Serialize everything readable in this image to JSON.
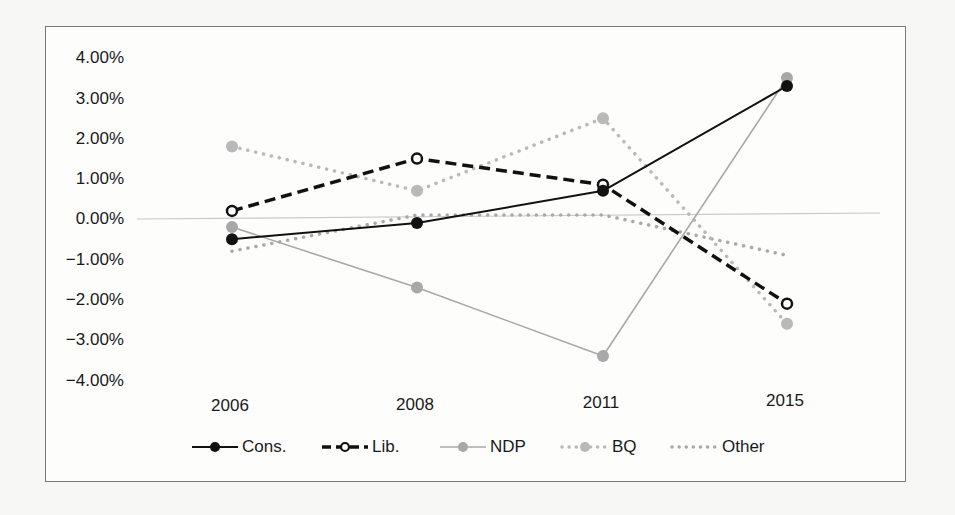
{
  "chart_data": {
    "type": "line",
    "title": "",
    "xlabel": "",
    "ylabel": "",
    "categories": [
      "2006",
      "2008",
      "2011",
      "2015"
    ],
    "y_ticks": [
      "4.00%",
      "3.00%",
      "2.00%",
      "1.00%",
      "0.00%",
      "-1.00%",
      "-2.00%",
      "-3.00%",
      "-4.00%"
    ],
    "y_tick_values": [
      4,
      3,
      2,
      1,
      0,
      -1,
      -2,
      -3,
      -4
    ],
    "ylim": [
      -4,
      4
    ],
    "y_unit": "%",
    "grid": false,
    "zero_line": true,
    "legend_position": "bottom",
    "series": [
      {
        "name": "Cons.",
        "values": [
          -0.5,
          -0.1,
          0.7,
          3.3
        ],
        "color": "#111111",
        "line": "solid",
        "width": 2,
        "marker": "filled"
      },
      {
        "name": "Lib.",
        "values": [
          0.2,
          1.5,
          0.85,
          -2.1
        ],
        "color": "#111111",
        "line": "dashed",
        "width": 3.5,
        "marker": "open"
      },
      {
        "name": "NDP",
        "values": [
          -0.2,
          -1.7,
          -3.4,
          3.5
        ],
        "color": "#a8a8a8",
        "line": "solid",
        "width": 1.6,
        "marker": "filled"
      },
      {
        "name": "BQ",
        "values": [
          1.8,
          0.7,
          2.5,
          -2.6
        ],
        "color": "#b9b9b9",
        "line": "dotted",
        "width": 3.5,
        "marker": "filled"
      },
      {
        "name": "Other",
        "values": [
          -0.8,
          0.1,
          0.1,
          -0.9
        ],
        "color": "#a9a9a9",
        "line": "dotted",
        "width": 3.5,
        "marker": "none"
      }
    ]
  },
  "legend": {
    "items": [
      "Cons.",
      "Lib.",
      "NDP",
      "BQ",
      "Other"
    ]
  }
}
